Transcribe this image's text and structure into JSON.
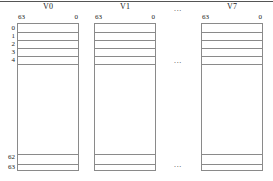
{
  "figure": {
    "caption_rule": true,
    "registers": [
      {
        "id": "v0",
        "title": "V0",
        "bit_high": "63",
        "bit_low": "0",
        "left": 17,
        "width": 62
      },
      {
        "id": "v1",
        "title": "V1",
        "bit_high": "63",
        "bit_low": "0",
        "left": 94,
        "width": 62
      },
      {
        "id": "v7",
        "title": "V7",
        "bit_high": "63",
        "bit_low": "0",
        "left": 201,
        "width": 62
      }
    ],
    "row_indices": [
      {
        "label": "0",
        "top": 24
      },
      {
        "label": "1",
        "top": 32
      },
      {
        "label": "2",
        "top": 40
      },
      {
        "label": "3",
        "top": 48
      },
      {
        "label": "4",
        "top": 56
      },
      {
        "label": "62",
        "top": 153
      },
      {
        "label": "63",
        "top": 163
      }
    ],
    "row_dividers_top": [
      8,
      16,
      24,
      32,
      40
    ],
    "row_dividers_bottom": [
      130,
      140
    ],
    "ellipses": [
      {
        "name": "ellipsis-top",
        "text": "...",
        "left": 163,
        "top": 5,
        "width": 30
      },
      {
        "name": "ellipsis-middle",
        "text": "...",
        "left": 163,
        "top": 57,
        "width": 30
      },
      {
        "name": "ellipsis-bottom",
        "text": "...",
        "left": 163,
        "top": 161,
        "width": 30
      }
    ],
    "colors": {
      "rule": "#555555",
      "box_border": "#8a8a8a",
      "text": "#1a1a1a",
      "background": "#ffffff"
    }
  }
}
